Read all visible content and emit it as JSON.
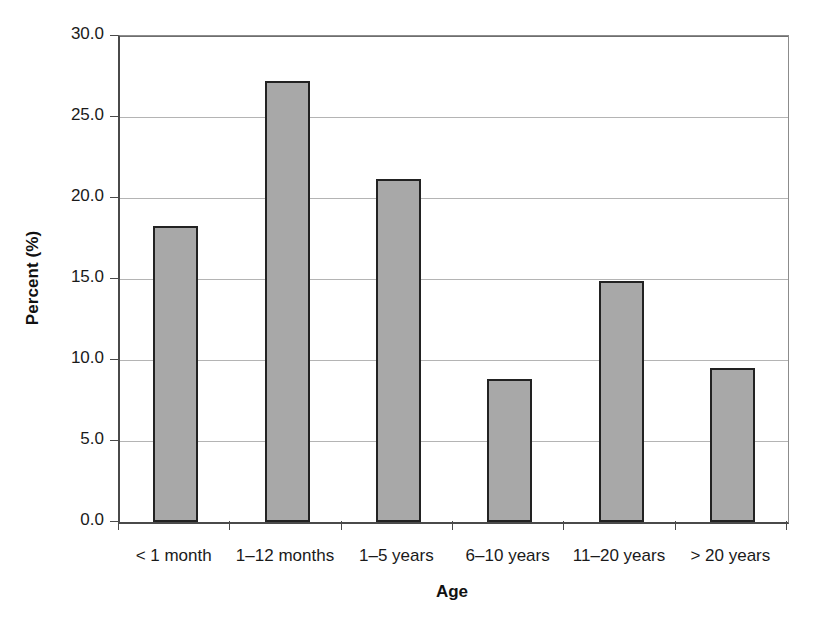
{
  "chart_data": {
    "type": "bar",
    "title": "",
    "subtitle": "",
    "xlabel": "Age",
    "ylabel": "Percent (%)",
    "categories": [
      "< 1 month",
      "1–12 months",
      "1–5 years",
      "6–10 years",
      "11–20 years",
      "> 20 years"
    ],
    "values": [
      18.3,
      27.2,
      21.2,
      8.8,
      14.9,
      9.5
    ],
    "ylim": [
      0.0,
      30.0
    ],
    "yticks": [
      0.0,
      5.0,
      10.0,
      15.0,
      20.0,
      25.0,
      30.0
    ],
    "ytick_labels": [
      "0.0",
      "5.0",
      "10.0",
      "15.0",
      "20.0",
      "25.0",
      "30.0"
    ],
    "ytick_step": 5.0,
    "grid": "horizontal",
    "legend": "none",
    "annotations": [],
    "colors": {
      "bar_fill": "#a8a8a8",
      "bar_border": "#222222",
      "gridline": "#b4b4b4",
      "axis": "#4a4a4a",
      "text": "#1a1a1a",
      "background": "#ffffff"
    }
  }
}
